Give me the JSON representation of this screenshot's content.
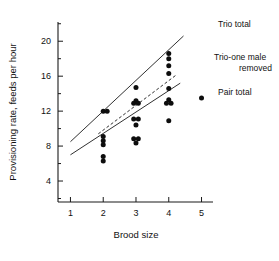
{
  "chart_data": {
    "type": "scatter",
    "title": "",
    "xlabel": "Brood size",
    "ylabel": "Provisioning rate,  feeds per hour",
    "xlim": [
      0.62,
      5.35
    ],
    "ylim": [
      1.6,
      22.2
    ],
    "xticks": [
      1,
      2,
      3,
      4,
      5
    ],
    "xticklabels": [
      "1",
      "2",
      "3",
      "4",
      "5"
    ],
    "yticks": [
      4,
      8,
      12,
      16,
      20
    ],
    "yticklabels": [
      "4",
      "8",
      "12",
      "16",
      "20"
    ],
    "yminorticks": [
      2,
      6,
      10,
      14,
      18,
      22
    ],
    "grid": false,
    "legend_position": "inline-right-labels",
    "points": [
      {
        "x": 2.0,
        "y": 12.0
      },
      {
        "x": 2.12,
        "y": 12.0
      },
      {
        "x": 2.0,
        "y": 9.1
      },
      {
        "x": 2.0,
        "y": 8.6
      },
      {
        "x": 2.0,
        "y": 8.15
      },
      {
        "x": 2.0,
        "y": 6.8
      },
      {
        "x": 2.0,
        "y": 6.3
      },
      {
        "x": 3.0,
        "y": 14.7
      },
      {
        "x": 3.0,
        "y": 13.2
      },
      {
        "x": 2.93,
        "y": 12.9
      },
      {
        "x": 3.07,
        "y": 12.9
      },
      {
        "x": 2.93,
        "y": 11.1
      },
      {
        "x": 3.07,
        "y": 11.1
      },
      {
        "x": 3.0,
        "y": 10.4
      },
      {
        "x": 2.93,
        "y": 8.85
      },
      {
        "x": 3.07,
        "y": 8.85
      },
      {
        "x": 3.0,
        "y": 8.35
      },
      {
        "x": 4.0,
        "y": 18.6
      },
      {
        "x": 4.0,
        "y": 18.0
      },
      {
        "x": 4.0,
        "y": 17.2
      },
      {
        "x": 4.0,
        "y": 16.3
      },
      {
        "x": 4.0,
        "y": 14.6
      },
      {
        "x": 4.0,
        "y": 13.3
      },
      {
        "x": 3.93,
        "y": 12.9
      },
      {
        "x": 4.07,
        "y": 12.9
      },
      {
        "x": 4.0,
        "y": 10.9
      },
      {
        "x": 5.0,
        "y": 13.5
      }
    ],
    "series": [
      {
        "name": "Trio total",
        "style": "solid",
        "label": "Trio total",
        "endpoints": [
          {
            "x": 1.0,
            "y": 8.5
          },
          {
            "x": 4.45,
            "y": 20.6
          }
        ]
      },
      {
        "name": "Trio-one male removed",
        "style": "dashed",
        "label_line1": "Trio-one male",
        "label_line2": "removed",
        "endpoints": [
          {
            "x": 1.85,
            "y": 9.4
          },
          {
            "x": 4.25,
            "y": 16.2
          }
        ]
      },
      {
        "name": "Pair total",
        "style": "solid",
        "label": "Pair total",
        "endpoints": [
          {
            "x": 1.0,
            "y": 7.0
          },
          {
            "x": 4.35,
            "y": 15.2
          }
        ]
      }
    ]
  }
}
